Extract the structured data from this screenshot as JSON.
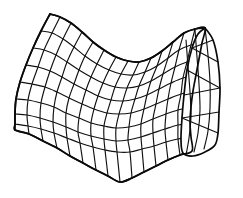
{
  "figure": {
    "background_color": "#ffffff",
    "line_color": "#111111",
    "boundary_color": "#0a0a0a",
    "line_width": 1.15,
    "boundary_width": 1.7,
    "canvas": {
      "width": 243,
      "height": 198
    }
  },
  "mesh": {
    "type": "parametric-quad-grid",
    "u_divisions": 14,
    "v_divisions": 8,
    "u_label": "columns",
    "v_label": "rows",
    "shading": "none",
    "hidden_line_removal": "partial",
    "patches": [
      {
        "name": "main-sheet",
        "columns": 11,
        "rows": 8
      },
      {
        "name": "right-fold-panel",
        "columns": 3,
        "rows": 8
      }
    ],
    "corners": {
      "top_left": [
        50,
        14
      ],
      "top_valley": [
        136,
        63
      ],
      "top_right": [
        205,
        28
      ],
      "right_lower": [
        218,
        140
      ],
      "bottom_right": [
        199,
        156
      ],
      "bottom_mid": [
        120,
        182
      ],
      "bottom_left": [
        15,
        130
      ]
    },
    "surface_geometry": {
      "kind": "hyperbolic-paraboloid-patch",
      "curvature": "negative",
      "fold_location": "right",
      "self_occlusion": true
    }
  },
  "control_grid": {
    "comment": "Control lattice in image pixel coordinates: rows of (x,y) knots, 15 columns x 9 rows, defining the surface patch",
    "rows": [
      [
        [
          50,
          14
        ],
        [
          60,
          17
        ],
        [
          71,
          23
        ],
        [
          82,
          32
        ],
        [
          93,
          42
        ],
        [
          104,
          50
        ],
        [
          116,
          57
        ],
        [
          128,
          61
        ],
        [
          139,
          62
        ],
        [
          151,
          58
        ],
        [
          162,
          51
        ],
        [
          173,
          42
        ],
        [
          184,
          33
        ],
        [
          195,
          29
        ],
        [
          205,
          28
        ]
      ],
      [
        [
          41,
          31
        ],
        [
          52,
          33
        ],
        [
          63,
          39
        ],
        [
          74,
          47
        ],
        [
          85,
          56
        ],
        [
          97,
          64
        ],
        [
          109,
          70
        ],
        [
          121,
          74
        ],
        [
          133,
          75
        ],
        [
          145,
          72
        ],
        [
          157,
          66
        ],
        [
          168,
          58
        ],
        [
          179,
          50
        ],
        [
          191,
          45
        ],
        [
          202,
          43
        ]
      ],
      [
        [
          33,
          48
        ],
        [
          44,
          50
        ],
        [
          56,
          55
        ],
        [
          67,
          62
        ],
        [
          79,
          70
        ],
        [
          91,
          77
        ],
        [
          103,
          83
        ],
        [
          115,
          87
        ],
        [
          127,
          88
        ],
        [
          139,
          86
        ],
        [
          151,
          81
        ],
        [
          163,
          74
        ],
        [
          175,
          67
        ],
        [
          187,
          62
        ],
        [
          199,
          59
        ]
      ],
      [
        [
          26,
          65
        ],
        [
          38,
          67
        ],
        [
          50,
          71
        ],
        [
          62,
          77
        ],
        [
          74,
          84
        ],
        [
          86,
          90
        ],
        [
          98,
          96
        ],
        [
          111,
          100
        ],
        [
          123,
          101
        ],
        [
          135,
          99
        ],
        [
          147,
          95
        ],
        [
          159,
          89
        ],
        [
          171,
          83
        ],
        [
          183,
          78
        ],
        [
          196,
          75
        ]
      ],
      [
        [
          20,
          82
        ],
        [
          32,
          84
        ],
        [
          45,
          87
        ],
        [
          57,
          92
        ],
        [
          69,
          98
        ],
        [
          82,
          104
        ],
        [
          94,
          109
        ],
        [
          107,
          113
        ],
        [
          119,
          114
        ],
        [
          131,
          113
        ],
        [
          144,
          109
        ],
        [
          156,
          104
        ],
        [
          168,
          99
        ],
        [
          181,
          94
        ],
        [
          193,
          91
        ]
      ],
      [
        [
          16,
          99
        ],
        [
          28,
          100
        ],
        [
          41,
          103
        ],
        [
          54,
          107
        ],
        [
          66,
          113
        ],
        [
          79,
          118
        ],
        [
          91,
          123
        ],
        [
          104,
          126
        ],
        [
          116,
          128
        ],
        [
          129,
          127
        ],
        [
          141,
          124
        ],
        [
          153,
          119
        ],
        [
          166,
          114
        ],
        [
          178,
          110
        ],
        [
          191,
          107
        ]
      ],
      [
        [
          15,
          114
        ],
        [
          27,
          115
        ],
        [
          40,
          118
        ],
        [
          53,
          122
        ],
        [
          66,
          127
        ],
        [
          78,
          132
        ],
        [
          91,
          136
        ],
        [
          104,
          139
        ],
        [
          116,
          141
        ],
        [
          128,
          140
        ],
        [
          141,
          137
        ],
        [
          153,
          133
        ],
        [
          165,
          129
        ],
        [
          178,
          125
        ],
        [
          190,
          123
        ]
      ],
      [
        [
          15,
          124
        ],
        [
          28,
          126
        ],
        [
          41,
          129
        ],
        [
          54,
          133
        ],
        [
          67,
          138
        ],
        [
          80,
          143
        ],
        [
          93,
          147
        ],
        [
          105,
          150
        ],
        [
          117,
          152
        ],
        [
          130,
          152
        ],
        [
          142,
          149
        ],
        [
          154,
          146
        ],
        [
          166,
          142
        ],
        [
          178,
          139
        ],
        [
          191,
          137
        ]
      ],
      [
        [
          15,
          130
        ],
        [
          29,
          134
        ],
        [
          43,
          141
        ],
        [
          57,
          148
        ],
        [
          70,
          156
        ],
        [
          83,
          163
        ],
        [
          96,
          170
        ],
        [
          108,
          176
        ],
        [
          120,
          182
        ],
        [
          132,
          178
        ],
        [
          144,
          172
        ],
        [
          156,
          166
        ],
        [
          168,
          160
        ],
        [
          180,
          155
        ],
        [
          192,
          151
        ]
      ]
    ]
  },
  "right_panel": {
    "comment": "The folded-over right panel that occludes part of the main sheet",
    "outline": [
      [
        205,
        28
      ],
      [
        213,
        40
      ],
      [
        218,
        62
      ],
      [
        220,
        88
      ],
      [
        219,
        112
      ],
      [
        218,
        133
      ],
      [
        215,
        145
      ],
      [
        205,
        152
      ],
      [
        193,
        156
      ],
      [
        183,
        153
      ],
      [
        181,
        140
      ],
      [
        182,
        118
      ],
      [
        184,
        95
      ],
      [
        187,
        70
      ],
      [
        192,
        48
      ],
      [
        198,
        34
      ]
    ],
    "verticals": [
      [
        [
          205,
          28
        ],
        [
          208,
          55
        ],
        [
          210,
          82
        ],
        [
          210,
          108
        ],
        [
          208,
          131
        ],
        [
          204,
          149
        ]
      ],
      [
        [
          195,
          30
        ],
        [
          197,
          57
        ],
        [
          199,
          84
        ],
        [
          200,
          110
        ],
        [
          198,
          133
        ],
        [
          194,
          152
        ]
      ],
      [
        [
          186,
          40
        ],
        [
          188,
          66
        ],
        [
          190,
          92
        ],
        [
          191,
          116
        ],
        [
          189,
          138
        ],
        [
          186,
          155
        ]
      ]
    ]
  },
  "annotations": {
    "visible_text": [],
    "has_axes": false,
    "has_legend": false,
    "has_labels": false
  }
}
